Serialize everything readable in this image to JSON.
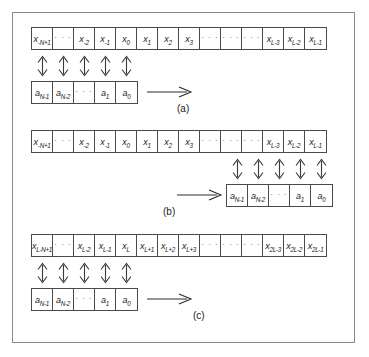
{
  "figure": {
    "panels": [
      {
        "id": "a",
        "caption": "(a)",
        "data_row": {
          "name": "data-sample-row",
          "cells": [
            {
              "base": "x",
              "sub": "-N+1"
            },
            {
              "dots": "· · ·"
            },
            {
              "base": "x",
              "sub": "-2"
            },
            {
              "base": "x",
              "sub": "-1"
            },
            {
              "base": "x",
              "sub": "0"
            },
            {
              "base": "x",
              "sub": "1"
            },
            {
              "base": "x",
              "sub": "2"
            },
            {
              "base": "x",
              "sub": "3"
            },
            {
              "dots": "· · ·"
            },
            {
              "dots": "· · ·"
            },
            {
              "dots": "· · ·"
            },
            {
              "base": "x",
              "sub": "L-3"
            },
            {
              "base": "x",
              "sub": "L-2"
            },
            {
              "base": "x",
              "sub": "L-1"
            }
          ]
        },
        "coef_row": {
          "name": "coefficient-row",
          "align": "left",
          "cells": [
            {
              "base": "a",
              "sub": "N-1"
            },
            {
              "base": "a",
              "sub": "N-2"
            },
            {
              "dots": "· · ·"
            },
            {
              "base": "a",
              "sub": "1"
            },
            {
              "base": "a",
              "sub": "0"
            }
          ]
        },
        "link_arrows": {
          "name": "bidirectional-link-arrows",
          "count": 5,
          "align": "left"
        },
        "slide_arrow": {
          "name": "slide-direction-arrow",
          "direction": "right",
          "position": "after-coefficients"
        }
      },
      {
        "id": "b",
        "caption": "(b)",
        "data_row": {
          "name": "data-sample-row",
          "cells": [
            {
              "base": "x",
              "sub": "-N+1"
            },
            {
              "dots": "· · ·"
            },
            {
              "base": "x",
              "sub": "-2"
            },
            {
              "base": "x",
              "sub": "-1"
            },
            {
              "base": "x",
              "sub": "0"
            },
            {
              "base": "x",
              "sub": "1"
            },
            {
              "base": "x",
              "sub": "2"
            },
            {
              "base": "x",
              "sub": "3"
            },
            {
              "dots": "· · ·"
            },
            {
              "dots": "· · ·"
            },
            {
              "dots": "· · ·"
            },
            {
              "base": "x",
              "sub": "L-3"
            },
            {
              "base": "x",
              "sub": "L-2"
            },
            {
              "base": "x",
              "sub": "L-1"
            }
          ]
        },
        "coef_row": {
          "name": "coefficient-row",
          "align": "right",
          "cells": [
            {
              "base": "a",
              "sub": "N-1"
            },
            {
              "base": "a",
              "sub": "N-2"
            },
            {
              "dots": "· · ·"
            },
            {
              "base": "a",
              "sub": "1"
            },
            {
              "base": "a",
              "sub": "0"
            }
          ]
        },
        "link_arrows": {
          "name": "bidirectional-link-arrows",
          "count": 5,
          "align": "right"
        },
        "slide_arrow": {
          "name": "slide-direction-arrow",
          "direction": "right",
          "position": "before-coefficients"
        }
      },
      {
        "id": "c",
        "caption": "(c)",
        "data_row": {
          "name": "data-sample-row",
          "cells": [
            {
              "base": "x",
              "sub": "L-N+1"
            },
            {
              "dots": "· · ·"
            },
            {
              "base": "x",
              "sub": "L-2"
            },
            {
              "base": "x",
              "sub": "L-1"
            },
            {
              "base": "x",
              "sub": "L"
            },
            {
              "base": "x",
              "sub": "L+1"
            },
            {
              "base": "x",
              "sub": "L+2"
            },
            {
              "base": "x",
              "sub": "L+3"
            },
            {
              "dots": "· · ·"
            },
            {
              "dots": "· · ·"
            },
            {
              "dots": "· · ·"
            },
            {
              "base": "x",
              "sub": "2L-3"
            },
            {
              "base": "x",
              "sub": "2L-2"
            },
            {
              "base": "x",
              "sub": "2L-1"
            }
          ]
        },
        "coef_row": {
          "name": "coefficient-row",
          "align": "left",
          "cells": [
            {
              "base": "a",
              "sub": "N-1"
            },
            {
              "base": "a",
              "sub": "N-2"
            },
            {
              "dots": "· · ·"
            },
            {
              "base": "a",
              "sub": "1"
            },
            {
              "base": "a",
              "sub": "0"
            }
          ]
        },
        "link_arrows": {
          "name": "bidirectional-link-arrows",
          "count": 5,
          "align": "left"
        },
        "slide_arrow": {
          "name": "slide-direction-arrow",
          "direction": "right",
          "position": "after-coefficients"
        }
      }
    ],
    "colors": {
      "cell_border": "#4a4a4a",
      "frame_border": "#8a8a8a",
      "text": "#1a1a1a",
      "background": "#ffffff"
    }
  }
}
